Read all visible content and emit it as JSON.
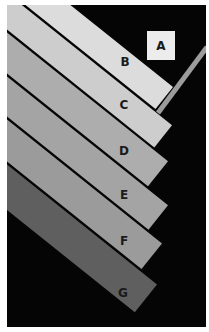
{
  "frame": {
    "x": 7,
    "y": 5,
    "width": 199,
    "height": 322,
    "background": "#050505",
    "border": "#ffffff"
  },
  "square_a": {
    "label": "A",
    "x": 147,
    "y": 31,
    "width": 28,
    "height": 29,
    "color": "#ececec",
    "label_x": 161,
    "label_y": 50
  },
  "rod": {
    "x1": 207,
    "y1": 47,
    "x2": 158,
    "y2": 113,
    "width": 5,
    "color": "#9c9c9c"
  },
  "strips": [
    {
      "label": "B",
      "color": "#dcdcdc",
      "points": "7,-45.7 173,87.1 155.5,108.9 7,-9.8",
      "label_x": 125,
      "label_y": 66
    },
    {
      "label": "C",
      "color": "#cdcdcd",
      "points": "7,-6.8 172,125.2 154.3,147.4 7,29.5",
      "label_x": 124,
      "label_y": 109
    },
    {
      "label": "D",
      "color": "#adadad",
      "points": "7,32.5 168,161.3 148,186.3 7,73.5",
      "label_x": 124,
      "label_y": 155
    },
    {
      "label": "E",
      "color": "#a4a4a4",
      "points": "7,76.5 168,205.3 148.5,229.7 7,116.5",
      "label_x": 124,
      "label_y": 199
    },
    {
      "label": "F",
      "color": "#9b9b9b",
      "points": "7,119.5 162,243.5 141.5,269.1 7,161.5",
      "label_x": 124,
      "label_y": 245
    },
    {
      "label": "G",
      "color": "#5f5f5f",
      "points": "7,164.5 157,284.5 134.8,312.2 7,210",
      "label_x": 123,
      "label_y": 297
    }
  ]
}
